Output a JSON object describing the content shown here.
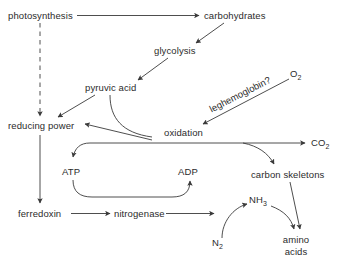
{
  "diagram": {
    "background_color": "#ffffff",
    "line_color": "#3a3a3a",
    "text_color": "#2b2b2b",
    "nodes": {
      "photosynthesis": "photosynthesis",
      "carbohydrates": "carbohydrates",
      "glycolysis": "glycolysis",
      "pyruvic_acid": "pyruvic acid",
      "oxygen": "O",
      "oxygen_sub": "2",
      "leghemoglobin": "leghemoglobin?",
      "reducing_power": "reducing power",
      "oxidation": "oxidation",
      "carbon_dioxide": "CO",
      "carbon_dioxide_sub": "2",
      "atp": "ATP",
      "adp": "ADP",
      "carbon_skeletons": "carbon skeletons",
      "ferredoxin": "ferredoxin",
      "nitrogenase": "nitrogenase",
      "ammonia": "NH",
      "ammonia_sub": "3",
      "dinitrogen": "N",
      "dinitrogen_sub": "2",
      "amino_line1": "amino",
      "amino_line2": "acids"
    },
    "edges": [
      {
        "from": "photosynthesis",
        "to": "carbohydrates",
        "style": "solid-arrow"
      },
      {
        "from": "photosynthesis",
        "to": "reducing power",
        "style": "dashed-arrow"
      },
      {
        "from": "carbohydrates",
        "to": "glycolysis",
        "style": "solid-arrow"
      },
      {
        "from": "glycolysis",
        "to": "pyruvic acid",
        "style": "solid-arrow"
      },
      {
        "from": "pyruvic acid",
        "to": "reducing power",
        "style": "solid-arrow"
      },
      {
        "from": "pyruvic acid",
        "to": "oxidation",
        "style": "curved"
      },
      {
        "from": "O2",
        "to": "oxidation",
        "style": "solid-arrow-labeled"
      },
      {
        "from": "oxidation",
        "to": "reducing power",
        "style": "solid-arrow"
      },
      {
        "from": "oxidation",
        "to": "CO2",
        "style": "solid-arrow"
      },
      {
        "from": "oxidation",
        "to": "ATP",
        "style": "curved-arrow"
      },
      {
        "from": "oxidation",
        "to": "carbon skeletons",
        "style": "curved-arrow"
      },
      {
        "from": "ATP",
        "to": "ADP",
        "style": "curved-arrow"
      },
      {
        "from": "reducing power",
        "to": "ferredoxin",
        "style": "solid-arrow"
      },
      {
        "from": "ferredoxin",
        "to": "nitrogenase",
        "style": "solid-arrow"
      },
      {
        "from": "nitrogenase",
        "to": "N2",
        "style": "solid-arrow"
      },
      {
        "from": "N2",
        "to": "NH3",
        "style": "curved-arrow"
      },
      {
        "from": "NH3",
        "to": "amino acids",
        "style": "curved-arrow"
      },
      {
        "from": "carbon skeletons",
        "to": "amino acids",
        "style": "solid-arrow"
      }
    ]
  }
}
